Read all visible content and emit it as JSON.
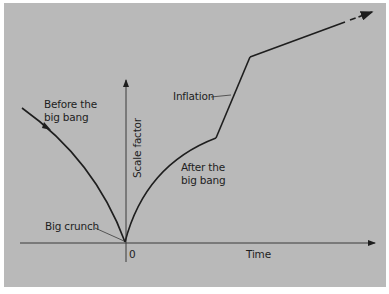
{
  "diagram": {
    "axes": {
      "y_label": "Scale factor",
      "x_label": "Time",
      "origin_label": "0"
    },
    "annotations": {
      "before_line1": "Before the",
      "before_line2": "big bang",
      "after_line1": "After the",
      "after_line2": "big bang",
      "inflation": "Inflation",
      "big_crunch": "Big crunch"
    },
    "colors": {
      "background": "#b9b9b9",
      "ink": "#1e1e1e"
    }
  }
}
